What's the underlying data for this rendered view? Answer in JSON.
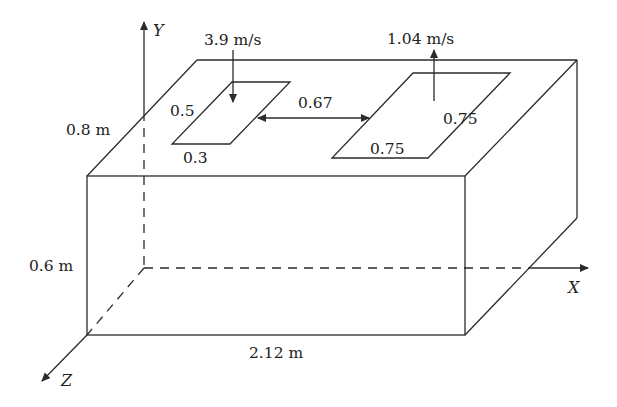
{
  "diagram": {
    "type": "3D box with inlet and outlet openings",
    "axes": {
      "x": "X",
      "y": "Y",
      "z": "Z"
    },
    "dimensions": {
      "length": "2.12 m",
      "depth": "0.8 m",
      "height": "0.6 m"
    },
    "inlet": {
      "velocity": "3.9 m/s",
      "direction": "down",
      "side_a": "0.5",
      "side_b": "0.3"
    },
    "outlet": {
      "velocity": "1.04 m/s",
      "direction": "up",
      "side_a": "0.75",
      "side_b": "0.75"
    },
    "spacing": "0.67"
  }
}
